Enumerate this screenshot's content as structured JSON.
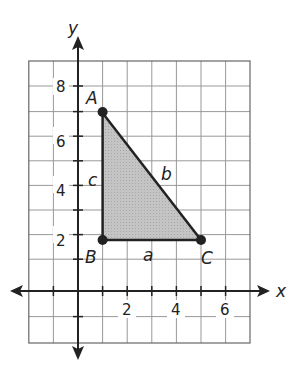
{
  "diagram": {
    "axes": {
      "x_label": "x",
      "y_label": "y"
    },
    "grid": {
      "x_min": -2,
      "x_max": 7,
      "y_min": -2,
      "y_max": 9
    },
    "x_ticks": [
      "2",
      "4",
      "6"
    ],
    "y_ticks": [
      "2",
      "4",
      "6",
      "8"
    ],
    "triangle": {
      "vertices": [
        {
          "name": "A",
          "x": 1,
          "y": 7
        },
        {
          "name": "B",
          "x": 1,
          "y": 2
        },
        {
          "name": "C",
          "x": 5,
          "y": 2
        }
      ],
      "sides": {
        "a": "a",
        "b": "b",
        "c": "c"
      },
      "fill": "#bdbdbd"
    }
  }
}
